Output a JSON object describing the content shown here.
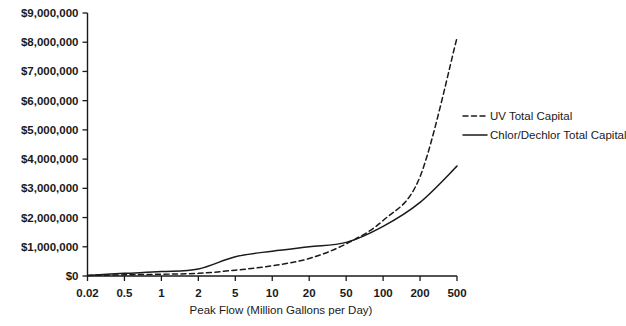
{
  "chart_data": {
    "type": "line",
    "title": "",
    "xlabel": "Peak Flow (Million Gallons per Day)",
    "ylabel": "",
    "categories": [
      "0.02",
      "0.5",
      "1",
      "2",
      "5",
      "10",
      "20",
      "50",
      "100",
      "200",
      "500"
    ],
    "x_tick_labels": [
      "0.02",
      "0.5",
      "1",
      "2",
      "5",
      "10",
      "20",
      "50",
      "100",
      "200",
      "500"
    ],
    "y_tick_labels": [
      "$0",
      "$1,000,000",
      "$2,000,000",
      "$3,000,000",
      "$4,000,000",
      "$5,000,000",
      "$6,000,000",
      "$7,000,000",
      "$8,000,000",
      "$9,000,000"
    ],
    "y_tick_values": [
      0,
      1000000,
      2000000,
      3000000,
      4000000,
      5000000,
      6000000,
      7000000,
      8000000,
      9000000
    ],
    "ylim": [
      0,
      9000000
    ],
    "grid": false,
    "legend_position": "right",
    "series": [
      {
        "name": "UV Total Capital",
        "style": "dashed",
        "color": "#1a1a1a",
        "values": [
          20000,
          40000,
          60000,
          90000,
          200000,
          350000,
          600000,
          1100000,
          1900000,
          3400000,
          8150000
        ]
      },
      {
        "name": "Chlor/Dechlor Total Capital",
        "style": "solid",
        "color": "#1a1a1a",
        "values": [
          20000,
          90000,
          150000,
          240000,
          660000,
          850000,
          1000000,
          1150000,
          1700000,
          2520000,
          3760000
        ]
      }
    ]
  },
  "legend": {
    "items": [
      {
        "label": "UV Total Capital",
        "style": "dashed"
      },
      {
        "label": "Chlor/Dechlor Total Capital",
        "style": "solid"
      }
    ]
  },
  "axes": {
    "x_title": "Peak Flow (Million Gallons per Day)"
  }
}
